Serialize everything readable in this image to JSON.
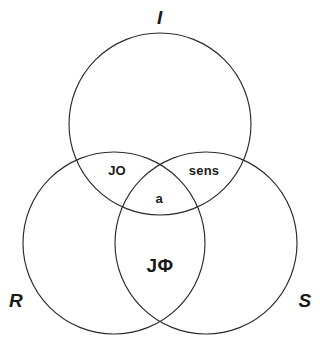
{
  "diagram": {
    "type": "venn-3-set",
    "background_color": "#ffffff",
    "stroke_color": "#2b2b2b",
    "text_color": "#1a1a1a",
    "width": 320,
    "height": 343,
    "sets": [
      {
        "id": "top",
        "label": "I",
        "label_position": "top",
        "center_x": 160,
        "center_y": 124,
        "radius": 91
      },
      {
        "id": "left",
        "label": "R",
        "label_position": "bottom-left",
        "center_x": 114,
        "center_y": 243,
        "radius": 91
      },
      {
        "id": "right",
        "label": "S",
        "label_position": "bottom-right",
        "center_x": 206,
        "center_y": 243,
        "radius": 91
      }
    ],
    "regions": [
      {
        "id": "top-left-overlap",
        "label": "JO",
        "sets": [
          "I",
          "R"
        ],
        "center_x": 117,
        "center_y": 170
      },
      {
        "id": "top-right-overlap",
        "label": "sens",
        "sets": [
          "I",
          "S"
        ],
        "center_x": 204,
        "center_y": 170
      },
      {
        "id": "center-overlap",
        "label": "a",
        "sets": [
          "I",
          "R",
          "S"
        ],
        "center_x": 159,
        "center_y": 198
      },
      {
        "id": "bottom-overlap",
        "label": "JΦ",
        "sets": [
          "R",
          "S"
        ],
        "center_x": 160,
        "center_y": 265
      }
    ]
  }
}
